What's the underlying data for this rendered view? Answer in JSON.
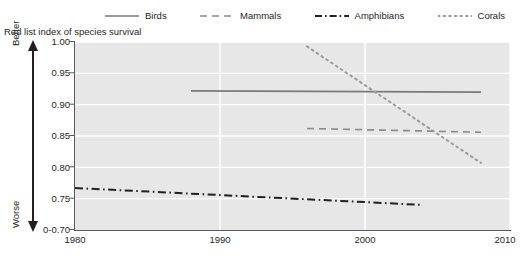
{
  "chart_data": {
    "type": "line",
    "title": "Red list index of species survival",
    "xlabel": "",
    "ylabel": "Red list index of species survival",
    "xlim": [
      1980,
      2010
    ],
    "ylim": [
      0.7,
      1.0
    ],
    "xticks": [
      "1980",
      "1990",
      "2000",
      "2010"
    ],
    "yticks": [
      "1.00",
      "0.95",
      "0.90",
      "0.85",
      "0.80",
      "0.75",
      "0-0.70"
    ],
    "ytick_values": [
      1.0,
      0.95,
      0.9,
      0.85,
      0.8,
      0.75,
      0.7
    ],
    "axis_break_note": "0-0.70",
    "grid": "horizontal-and-vertical-white",
    "legend_position": "top",
    "direction_labels": {
      "top": "Better",
      "bottom": "Worse"
    },
    "series": [
      {
        "name": "Birds",
        "style": "solid",
        "color": "#7a7a7a",
        "x": [
          1988,
          2008
        ],
        "values": [
          0.922,
          0.92
        ]
      },
      {
        "name": "Mammals",
        "style": "dashed",
        "color": "#8c8c8c",
        "x": [
          1996,
          2008
        ],
        "values": [
          0.862,
          0.856
        ]
      },
      {
        "name": "Amphibians",
        "style": "dash-dot",
        "color": "#231f20",
        "x": [
          1980,
          2004
        ],
        "values": [
          0.767,
          0.74
        ]
      },
      {
        "name": "Corals",
        "style": "dotted",
        "color": "#9a9a9a",
        "x": [
          1996,
          2008
        ],
        "values": [
          0.993,
          0.807
        ]
      }
    ]
  },
  "legend": {
    "items": [
      {
        "label": "Birds",
        "icon": "solid-line-icon"
      },
      {
        "label": "Mammals",
        "icon": "dashed-line-icon"
      },
      {
        "label": "Amphibians",
        "icon": "dash-dot-line-icon"
      },
      {
        "label": "Corals",
        "icon": "dotted-line-icon"
      }
    ]
  },
  "axis": {
    "title": "Red list index of species survival",
    "better_label": "Better",
    "worse_label": "Worse",
    "y_labels": [
      "1.00",
      "0.95",
      "0.90",
      "0.85",
      "0.80",
      "0.75",
      "0-0.70"
    ],
    "x_labels": [
      "1980",
      "1990",
      "2000",
      "2010"
    ]
  },
  "colors": {
    "plot_background": "#e7e7e7",
    "gridline": "#ffffff",
    "axis": "#58595b",
    "text": "#231f20"
  }
}
